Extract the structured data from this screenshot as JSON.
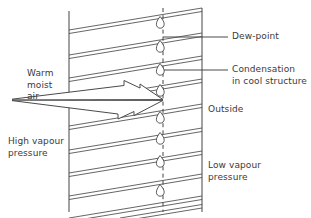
{
  "diagram": {
    "type": "technical-cross-section",
    "canvas": {
      "width": 311,
      "height": 218
    },
    "colors": {
      "background": "#ffffff",
      "line": "#444444",
      "hatch": "#555555",
      "text": "#3a3a3a"
    },
    "labels": {
      "dew_point": "Dew-point",
      "condensation_line1": "Condensation",
      "condensation_line2": "in cool structure",
      "outside": "Outside",
      "warm_moist_air_line1": "Warm",
      "warm_moist_air_line2": "moist",
      "warm_moist_air_line3": "air",
      "high_vapour_line1": "High vapour",
      "high_vapour_line2": "pressure",
      "low_vapour_line1": "Low vapour",
      "low_vapour_line2": "pressure"
    },
    "geometry": {
      "wall_left_x": 69,
      "wall_right_x": 202,
      "dew_point_x": 163,
      "wall_top_y": 10,
      "wall_bottom_y": 212,
      "hatch_angle_note": "double parallel lines rising to the right",
      "hatch_pair_count": 9
    },
    "droplet_positions_y": [
      22,
      46,
      69,
      90,
      117,
      138,
      161,
      190
    ],
    "leaders": [
      {
        "name": "dew-point",
        "from_x": 163,
        "y": 37,
        "to_x": 228
      },
      {
        "name": "condensation",
        "from_x": 163,
        "y": 70,
        "to_x": 228
      }
    ],
    "flow_arrow": {
      "name": "vapour-flow-arrow",
      "direction": "left-to-right",
      "tail_x": 12,
      "tip_x": 163,
      "axis_y": 100,
      "head_count": 2
    }
  }
}
